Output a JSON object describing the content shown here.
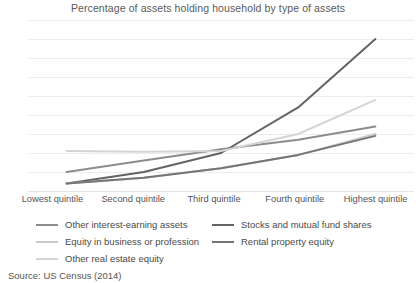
{
  "chart_data": {
    "type": "line",
    "title": "Percentage of assets holding household by type of assets",
    "xlabel": "",
    "ylabel": "",
    "categories": [
      "Lowest quintile",
      "Second quintile",
      "Third quintile",
      "Fourth quintile",
      "Highest quintile"
    ],
    "ylim": [
      0,
      45
    ],
    "yticks": [
      0,
      5,
      10,
      15,
      20,
      25,
      30,
      35,
      40,
      45
    ],
    "grid": true,
    "legend_position": "bottom",
    "source": "Source: US Census (2014)",
    "series": [
      {
        "name": "Other interest-earning assets",
        "color": "#8c8c8c",
        "values": [
          5.0,
          8.0,
          11.0,
          13.5,
          17.0
        ]
      },
      {
        "name": "Stocks and mutual fund shares",
        "color": "#636363",
        "values": [
          2.0,
          5.0,
          10.0,
          22.0,
          40.0
        ]
      },
      {
        "name": "Equity in business or profession",
        "color": "#c9c9c9",
        "values": [
          2.0,
          3.5,
          6.0,
          9.5,
          15.0
        ]
      },
      {
        "name": "Rental property equity",
        "color": "#757575",
        "values": [
          2.0,
          3.5,
          6.0,
          9.5,
          14.5
        ]
      },
      {
        "name": "Other real estate equity",
        "color": "#d4d4d4",
        "values": [
          10.5,
          10.3,
          10.5,
          15.0,
          24.0
        ]
      }
    ]
  }
}
